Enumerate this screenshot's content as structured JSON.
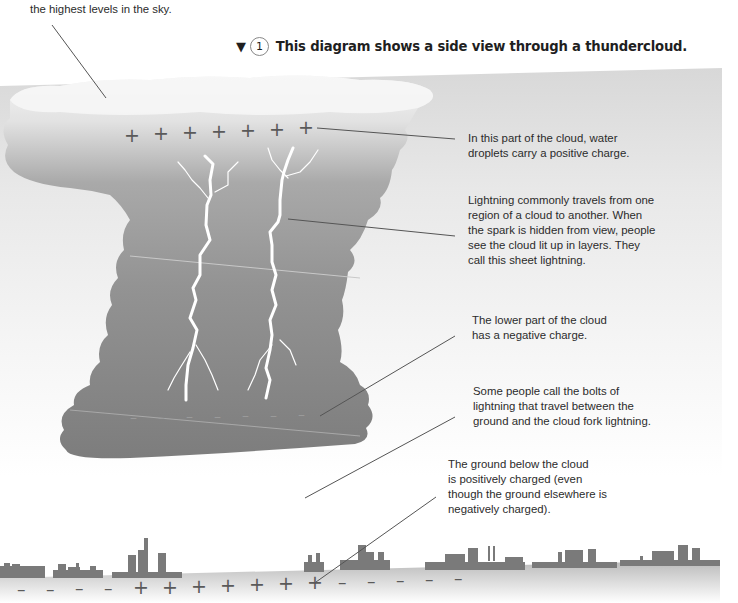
{
  "top_note": {
    "text": "the highest levels in the sky."
  },
  "caption": {
    "marker": "▼",
    "number": "1",
    "text": "This diagram shows a side view through a thundercloud."
  },
  "annotations": [
    {
      "id": "positive-charge",
      "lines": [
        "In this part of the cloud, water",
        "droplets carry a positive charge."
      ]
    },
    {
      "id": "sheet-lightning",
      "lines": [
        "Lightning commonly travels from one",
        "region of a cloud to another. When",
        "the spark is hidden from view, people",
        "see the cloud lit up in layers. They",
        "call this sheet lightning."
      ]
    },
    {
      "id": "negative-charge",
      "lines": [
        "The lower part of the cloud",
        "has a negative charge."
      ]
    },
    {
      "id": "fork-lightning",
      "lines": [
        "Some people call the bolts of",
        "lightning that travel between the",
        "ground and the cloud fork lightning."
      ]
    },
    {
      "id": "ground-charge",
      "lines": [
        "The ground below the cloud",
        "is positively charged (even",
        "though the ground elsewhere is",
        "negatively charged)."
      ]
    }
  ],
  "charges": {
    "cloud_top": [
      "+",
      "+",
      "+",
      "+",
      "+",
      "+",
      "+"
    ],
    "cloud_bottom": [
      "–",
      "–",
      "–",
      "–",
      "–",
      "–",
      "–"
    ],
    "ground": [
      "–",
      "–",
      "–",
      "–",
      "+",
      "+",
      "+",
      "+",
      "+",
      "+",
      "+",
      "–",
      "–",
      "–",
      "–",
      "–"
    ]
  },
  "colors": {
    "cloud_top": "#f2f2f2",
    "cloud_body": "#8c8c8c",
    "cloud_bottom": "#7f7f7f",
    "lightning": "#ffffff",
    "buildings": "#7a7a7a",
    "leader_line": "#555555"
  }
}
